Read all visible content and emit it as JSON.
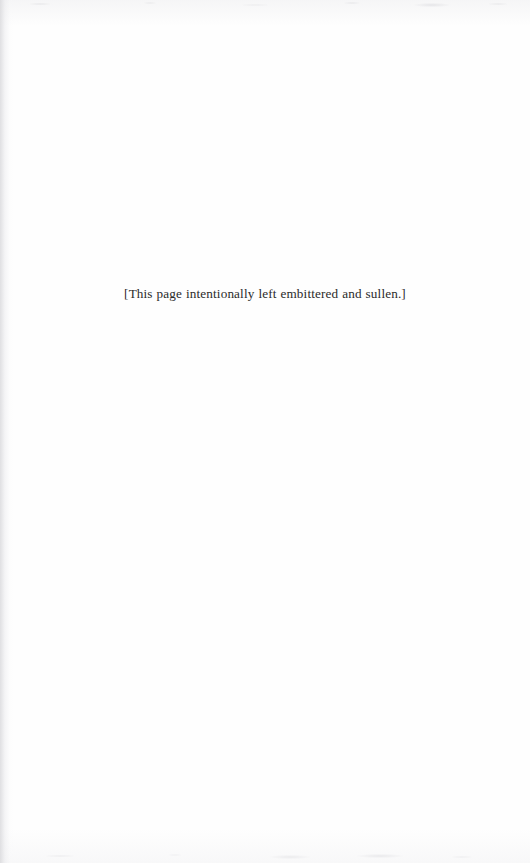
{
  "page": {
    "kind": "scanned-book-page",
    "width": 530,
    "height": 863,
    "paper_color": "#fefefe",
    "ink_color": "#2a2a2a",
    "gutter_shadow_color": "#d8d8db"
  },
  "content": {
    "notice": "[This page intentionally left embittered and sullen.]"
  }
}
